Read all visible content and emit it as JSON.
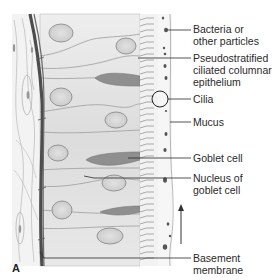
{
  "figure": {
    "panel_letter": "A",
    "labels": [
      {
        "id": "bacteria",
        "text": "Bacteria or\nother particles",
        "x": 193,
        "y": 23
      },
      {
        "id": "epithelium",
        "text": "Pseudostratified\nciliated columnar\nepithelium",
        "x": 193,
        "y": 52
      },
      {
        "id": "cilia",
        "text": "Cilia",
        "x": 193,
        "y": 93
      },
      {
        "id": "mucus",
        "text": "Mucus",
        "x": 193,
        "y": 116
      },
      {
        "id": "goblet-cell",
        "text": "Goblet cell",
        "x": 193,
        "y": 151
      },
      {
        "id": "goblet-nucleus",
        "text": "Nucleus of\ngoblet cell",
        "x": 193,
        "y": 169
      },
      {
        "id": "basement-membrane",
        "text": "Basement\nmembrane",
        "x": 193,
        "y": 251
      }
    ],
    "arrow": {
      "direction": "up",
      "meaning": "mucus flow"
    },
    "colors": {
      "cell_fill": "#e4e4e4",
      "cell_outline": "#9a9a9a",
      "nucleus_fill": "#d2d2d2",
      "goblet_fill": "#8e8e8e",
      "basement_membrane": "#5a5a5a",
      "cilia": "#8a8a8a",
      "mucus": "#f2f2f2",
      "particles": "#555555",
      "leader_line": "#2a2a2a",
      "text": "#2a2a2a"
    }
  }
}
